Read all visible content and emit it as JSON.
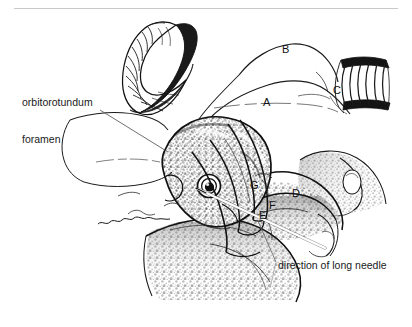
{
  "figure": {
    "type": "anatomical-line-drawing",
    "background_color": "#ffffff",
    "ink_color": "#111111",
    "rule_color": "#c9c9c9",
    "width": 412,
    "height": 327
  },
  "annotations": {
    "foramen_label": {
      "line1": "orbitorotundum",
      "line2": "foramen",
      "x": 22,
      "y": 73
    },
    "needle_label": {
      "text": "direction of long needle",
      "x": 278,
      "y": 265
    }
  },
  "key_letters": [
    {
      "id": "A",
      "label": "A",
      "x": 266,
      "y": 103
    },
    {
      "id": "B",
      "label": "B",
      "x": 285,
      "y": 50
    },
    {
      "id": "C",
      "label": "C",
      "x": 336,
      "y": 91
    },
    {
      "id": "D",
      "label": "D",
      "x": 295,
      "y": 194
    },
    {
      "id": "E",
      "label": "E",
      "x": 262,
      "y": 216
    },
    {
      "id": "F",
      "label": "F",
      "x": 272,
      "y": 206
    },
    {
      "id": "G",
      "label": "G",
      "x": 253,
      "y": 186
    }
  ],
  "leader_lines": [
    {
      "name": "foramen-leader",
      "from_x": 100,
      "from_y": 110,
      "to_x": 168,
      "to_y": 152
    },
    {
      "name": "needle-leader",
      "from_x": 276,
      "from_y": 262,
      "to_x": 258,
      "to_y": 222
    }
  ],
  "needle": {
    "name": "long-needle",
    "from_x": 325,
    "from_y": 248,
    "to_x": 198,
    "to_y": 189,
    "color": "#ffffff"
  },
  "structures": [
    {
      "name": "horn",
      "description": "curved ridged horn, upper left"
    },
    {
      "name": "cranium-dorsal",
      "description": "dorsal skull outline labeled B"
    },
    {
      "name": "temporal-ridge",
      "description": "ridge labeled A"
    },
    {
      "name": "ear-canal",
      "description": "striated band labeled C"
    },
    {
      "name": "orbit",
      "description": "textured orbital bone with eye socket"
    },
    {
      "name": "mandible-ramus",
      "description": "lower jaw ramus labeled D"
    },
    {
      "name": "zygomatic-arch",
      "description": "arch region near E F G"
    }
  ]
}
